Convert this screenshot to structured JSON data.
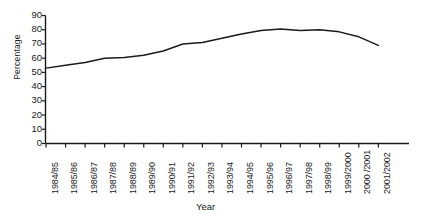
{
  "chart_data": {
    "type": "line",
    "title": "",
    "xlabel": "Year",
    "ylabel": "Percentage",
    "ylim": [
      0,
      90
    ],
    "ytick_step": 10,
    "yticks": [
      0,
      10,
      20,
      30,
      40,
      50,
      60,
      70,
      80,
      90
    ],
    "grid": false,
    "legend": "none",
    "line_color": "#1a1a1a",
    "categories": [
      "1984/85",
      "1985/86",
      "1986/87",
      "1987/88",
      "1988/89",
      "1989/90",
      "1990/91",
      "1991/92",
      "1992/93",
      "1993/94",
      "1994/95",
      "1995/96",
      "1996/97",
      "1997/98",
      "1998/99",
      "1999/2000",
      "2000 /2001",
      "2001/2002"
    ],
    "values": [
      53,
      55,
      57,
      60,
      60.5,
      62,
      65,
      70,
      71,
      74,
      77,
      79.5,
      80.5,
      79.5,
      80,
      78.5,
      75,
      69
    ]
  }
}
